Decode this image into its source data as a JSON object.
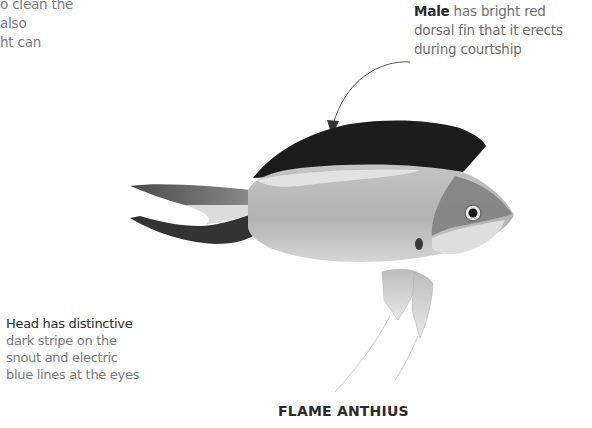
{
  "captions": {
    "top_left_fragment": {
      "lines": [
        "o clean the",
        "also",
        "ht can"
      ]
    },
    "male": {
      "lead": "Male",
      "line1_rest": " has bright red",
      "line2": "dorsal fin that it erects",
      "line3": "during courtship"
    },
    "head": {
      "lead": "Head has distinctive",
      "line2": "dark stripe on the",
      "line3": "snout and electric",
      "line4": "blue lines at the eyes"
    }
  },
  "title": "FLAME ANTHIUS",
  "illustration": {
    "subject": "flame-anthias-fish",
    "colors": {
      "dorsal_fin": "#1c1c1c",
      "body": "#b8b8b8",
      "belly": "#d8d8d8",
      "head_stripe": "#7a7a7a",
      "tail_dark": "#3a3a3a",
      "leader_line": "#555555"
    }
  }
}
